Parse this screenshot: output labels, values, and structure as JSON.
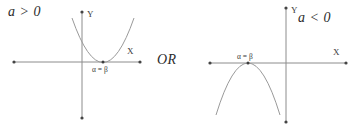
{
  "figure": {
    "connector_label": "OR",
    "plots": [
      {
        "id": "left",
        "coefficient_condition": "a > 0",
        "x_axis_label": "X",
        "y_axis_label": "Y",
        "root_label": "α = β",
        "parabola_direction": "opens-upward",
        "vertex_position": "on-x-axis",
        "curve_color": "#9a9a9a",
        "axis_color": "#8c8c8c"
      },
      {
        "id": "right",
        "coefficient_condition": "a < 0",
        "x_axis_label": "X",
        "y_axis_label": "Y",
        "root_label": "α = β",
        "parabola_direction": "opens-downward",
        "vertex_position": "on-x-axis",
        "curve_color": "#9a9a9a",
        "axis_color": "#8c8c8c"
      }
    ]
  }
}
